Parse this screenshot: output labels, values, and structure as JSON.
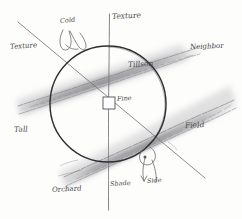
{
  "diagram": {
    "medium": "pencil sketch on white paper",
    "center_marker": "small-white-square",
    "ink_color": "#5a5a5c",
    "smudge_color": "#9a9a9d",
    "paper_color": "#fdfdfc"
  },
  "labels": {
    "top_center": "Texture",
    "top_left_inner": "Cold",
    "left_upper": "Texture",
    "right_upper": "Neighbor",
    "inner_right": "Tillson",
    "center": "Fine",
    "left_lower": "Tall",
    "right_lower": "Field",
    "bottom_center": "Shade",
    "bottom_left": "Orchard",
    "bottom_right": "Side"
  },
  "geometry": {
    "circle_center_x": 108,
    "circle_center_y": 104,
    "circle_radius": 58,
    "vertical_axis_top_y": 14,
    "vertical_axis_bottom_y": 210,
    "diagonal_start_x": 18,
    "diagonal_start_y": 22,
    "diagonal_end_x": 205,
    "diagonal_end_y": 178,
    "band_upper_label": "upper-smudge-band",
    "band_lower_label": "lower-smudge-band"
  },
  "sketch_marks": {
    "top_loop": "loop-doodle",
    "bottom_loop": "arrow-loop-doodle"
  }
}
